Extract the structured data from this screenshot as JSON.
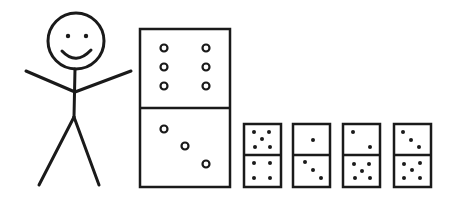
{
  "figure": {
    "stroke_color": "#1a1a1a",
    "background": "#ffffff"
  },
  "stick_figure": {
    "face": "smiling"
  },
  "large_domino": {
    "top_pips": 6,
    "bottom_pips": 3,
    "pip_style": "hollow"
  },
  "small_dominoes": [
    {
      "top_pips": 5,
      "bottom_pips": 4
    },
    {
      "top_pips": 1,
      "bottom_pips": 3
    },
    {
      "top_pips": 2,
      "bottom_pips": 5
    },
    {
      "top_pips": 3,
      "bottom_pips": 5
    }
  ]
}
